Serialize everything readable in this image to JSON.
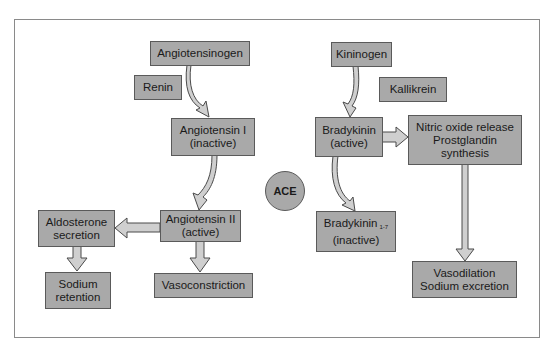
{
  "diagram": {
    "colors": {
      "box_fill": "#a9a9a9",
      "box_border": "#5a5a5a",
      "arrow_fill": "#cfcfcf",
      "arrow_stroke": "#4a4a4a"
    },
    "center_enzyme": "ACE",
    "nodes": {
      "angiotensinogen": {
        "lines": [
          "Angiotensinogen"
        ]
      },
      "renin": {
        "lines": [
          "Renin"
        ]
      },
      "angiotensin_1": {
        "lines": [
          "Angiotensin I",
          "(inactive)"
        ]
      },
      "angiotensin_2": {
        "lines": [
          "Angiotensin II",
          "(active)"
        ]
      },
      "aldosterone": {
        "lines": [
          "Aldosterone",
          "secretion"
        ]
      },
      "sodium_retention": {
        "lines": [
          "Sodium",
          "retention"
        ]
      },
      "vasoconstriction": {
        "lines": [
          "Vasoconstriction"
        ]
      },
      "kininogen": {
        "lines": [
          "Kininogen"
        ]
      },
      "kallikrein": {
        "lines": [
          "Kallikrein"
        ]
      },
      "bradykinin_active": {
        "lines": [
          "Bradykinin",
          "(active)"
        ]
      },
      "nitric_oxide": {
        "lines": [
          "Nitric oxide release",
          "Prostglandin",
          "synthesis"
        ]
      },
      "bradykinin_1_7": {
        "label": "Bradykinin",
        "subscript": "1-7",
        "line2": "(inactive)"
      },
      "vasodilation": {
        "lines": [
          "Vasodilation",
          "Sodium excretion"
        ]
      }
    },
    "edges": [
      {
        "from": "angiotensinogen",
        "to": "angiotensin_1",
        "enzyme": "renin"
      },
      {
        "from": "angiotensin_1",
        "to": "angiotensin_2",
        "enzyme": "ACE"
      },
      {
        "from": "angiotensin_2",
        "to": "aldosterone"
      },
      {
        "from": "angiotensin_2",
        "to": "vasoconstriction"
      },
      {
        "from": "aldosterone",
        "to": "sodium_retention"
      },
      {
        "from": "kininogen",
        "to": "bradykinin_active",
        "enzyme": "kallikrein"
      },
      {
        "from": "bradykinin_active",
        "to": "nitric_oxide"
      },
      {
        "from": "bradykinin_active",
        "to": "bradykinin_1_7",
        "enzyme": "ACE"
      },
      {
        "from": "nitric_oxide",
        "to": "vasodilation"
      }
    ]
  }
}
